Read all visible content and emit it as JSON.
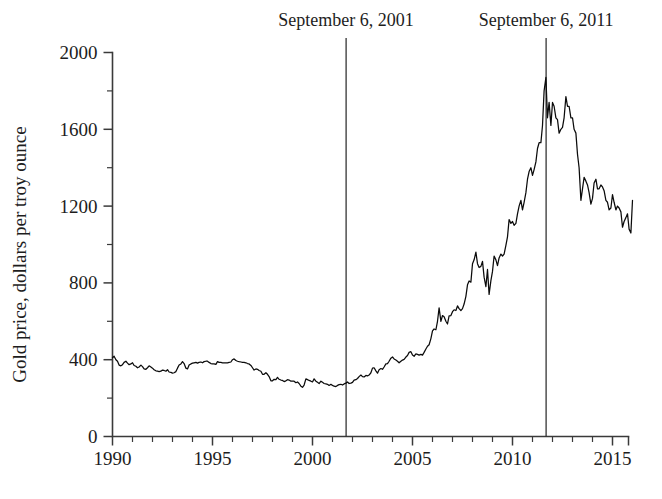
{
  "figure": {
    "background_color": "#ffffff",
    "line_color": "#0b0b0b",
    "axis_color": "#3a3a3a",
    "annotation_color": "#2c2c2c"
  },
  "chart_data": {
    "type": "line",
    "title": "",
    "subtitle": "",
    "xlabel": "",
    "ylabel": "Gold price, dollars per troy ounce",
    "xlim": [
      1990,
      2015.8
    ],
    "ylim": [
      0,
      2000
    ],
    "grid": false,
    "legend": "none",
    "x_major_ticks": [
      1990,
      1995,
      2000,
      2005,
      2010,
      2015
    ],
    "x_major_tick_labels": [
      "1990",
      "1995",
      "2000",
      "2005",
      "2010",
      "2015"
    ],
    "x_minor_ticks": [
      1991,
      1992,
      1993,
      1994,
      1996,
      1997,
      1998,
      1999,
      2001,
      2002,
      2003,
      2004,
      2006,
      2007,
      2008,
      2009,
      2011,
      2012,
      2013,
      2014
    ],
    "y_major_ticks": [
      0,
      400,
      800,
      1200,
      1600,
      2000
    ],
    "y_major_tick_labels": [
      "0",
      "400",
      "800",
      "1200",
      "1600",
      "2000"
    ],
    "y_minor_ticks": [
      200,
      600,
      1000,
      1400,
      1800
    ],
    "annotations": [
      {
        "label": "September 6, 2001",
        "x": 2001.68,
        "type": "vertical-rule"
      },
      {
        "label": "September 6, 2011",
        "x": 2011.68,
        "type": "vertical-rule"
      }
    ],
    "series": [
      {
        "name": "Gold price",
        "x": [
          1990.0,
          1990.08,
          1990.17,
          1990.25,
          1990.33,
          1990.42,
          1990.5,
          1990.58,
          1990.67,
          1990.75,
          1990.83,
          1990.92,
          1991.0,
          1991.08,
          1991.17,
          1991.25,
          1991.33,
          1991.42,
          1991.5,
          1991.58,
          1991.67,
          1991.75,
          1991.83,
          1991.92,
          1992.0,
          1992.08,
          1992.17,
          1992.25,
          1992.33,
          1992.42,
          1992.5,
          1992.58,
          1992.67,
          1992.75,
          1992.83,
          1992.92,
          1993.0,
          1993.08,
          1993.17,
          1993.25,
          1993.33,
          1993.42,
          1993.5,
          1993.58,
          1993.67,
          1993.75,
          1993.83,
          1993.92,
          1994.0,
          1994.08,
          1994.17,
          1994.25,
          1994.33,
          1994.42,
          1994.5,
          1994.58,
          1994.67,
          1994.75,
          1994.83,
          1994.92,
          1995.0,
          1995.08,
          1995.17,
          1995.25,
          1995.33,
          1995.42,
          1995.5,
          1995.58,
          1995.67,
          1995.75,
          1995.83,
          1995.92,
          1996.0,
          1996.08,
          1996.17,
          1996.25,
          1996.33,
          1996.42,
          1996.5,
          1996.58,
          1996.67,
          1996.75,
          1996.83,
          1996.92,
          1997.0,
          1997.08,
          1997.17,
          1997.25,
          1997.33,
          1997.42,
          1997.5,
          1997.58,
          1997.67,
          1997.75,
          1997.83,
          1997.92,
          1998.0,
          1998.08,
          1998.17,
          1998.25,
          1998.33,
          1998.42,
          1998.5,
          1998.58,
          1998.67,
          1998.75,
          1998.83,
          1998.92,
          1999.0,
          1999.08,
          1999.17,
          1999.25,
          1999.33,
          1999.42,
          1999.5,
          1999.58,
          1999.67,
          1999.75,
          1999.83,
          1999.92,
          2000.0,
          2000.08,
          2000.17,
          2000.25,
          2000.33,
          2000.42,
          2000.5,
          2000.58,
          2000.67,
          2000.75,
          2000.83,
          2000.92,
          2001.0,
          2001.08,
          2001.17,
          2001.25,
          2001.33,
          2001.42,
          2001.5,
          2001.58,
          2001.67,
          2001.75,
          2001.83,
          2001.92,
          2002.0,
          2002.08,
          2002.17,
          2002.25,
          2002.33,
          2002.42,
          2002.5,
          2002.58,
          2002.67,
          2002.75,
          2002.83,
          2002.92,
          2003.0,
          2003.08,
          2003.17,
          2003.25,
          2003.33,
          2003.42,
          2003.5,
          2003.58,
          2003.67,
          2003.75,
          2003.83,
          2003.92,
          2004.0,
          2004.08,
          2004.17,
          2004.25,
          2004.33,
          2004.42,
          2004.5,
          2004.58,
          2004.67,
          2004.75,
          2004.83,
          2004.92,
          2005.0,
          2005.08,
          2005.17,
          2005.25,
          2005.33,
          2005.42,
          2005.5,
          2005.58,
          2005.67,
          2005.75,
          2005.83,
          2005.92,
          2006.0,
          2006.08,
          2006.17,
          2006.25,
          2006.33,
          2006.42,
          2006.5,
          2006.58,
          2006.67,
          2006.75,
          2006.83,
          2006.92,
          2007.0,
          2007.08,
          2007.17,
          2007.25,
          2007.33,
          2007.42,
          2007.5,
          2007.58,
          2007.67,
          2007.75,
          2007.83,
          2007.92,
          2008.0,
          2008.08,
          2008.17,
          2008.25,
          2008.33,
          2008.42,
          2008.5,
          2008.58,
          2008.67,
          2008.75,
          2008.83,
          2008.92,
          2009.0,
          2009.08,
          2009.17,
          2009.25,
          2009.33,
          2009.42,
          2009.5,
          2009.58,
          2009.67,
          2009.75,
          2009.83,
          2009.92,
          2010.0,
          2010.08,
          2010.17,
          2010.25,
          2010.33,
          2010.42,
          2010.5,
          2010.58,
          2010.67,
          2010.75,
          2010.83,
          2010.92,
          2011.0,
          2011.08,
          2011.17,
          2011.25,
          2011.33,
          2011.42,
          2011.5,
          2011.58,
          2011.67,
          2011.75,
          2011.83,
          2011.92,
          2012.0,
          2012.08,
          2012.17,
          2012.25,
          2012.33,
          2012.42,
          2012.5,
          2012.58,
          2012.67,
          2012.75,
          2012.83,
          2012.92,
          2013.0,
          2013.08,
          2013.17,
          2013.25,
          2013.33,
          2013.42,
          2013.5,
          2013.58,
          2013.67,
          2013.75,
          2013.83,
          2013.92,
          2014.0,
          2014.08,
          2014.17,
          2014.25,
          2014.33,
          2014.42,
          2014.5,
          2014.58,
          2014.67,
          2014.75,
          2014.83,
          2014.92,
          2015.0,
          2015.08,
          2015.17,
          2015.25,
          2015.33,
          2015.42,
          2015.5,
          2015.58,
          2015.67,
          2015.75,
          2015.83,
          2015.92,
          2016.0
        ],
        "values": [
          410,
          418,
          400,
          392,
          372,
          368,
          374,
          386,
          392,
          382,
          374,
          378,
          384,
          370,
          366,
          358,
          362,
          372,
          364,
          352,
          350,
          358,
          368,
          362,
          356,
          348,
          342,
          340,
          338,
          340,
          346,
          344,
          340,
          348,
          336,
          334,
          330,
          332,
          338,
          356,
          372,
          378,
          390,
          380,
          356,
          352,
          372,
          378,
          382,
          384,
          386,
          382,
          386,
          388,
          384,
          390,
          392,
          392,
          386,
          380,
          378,
          378,
          376,
          390,
          386,
          386,
          384,
          384,
          384,
          384,
          386,
          388,
          400,
          404,
          396,
          392,
          390,
          388,
          386,
          386,
          384,
          380,
          378,
          370,
          358,
          346,
          352,
          350,
          344,
          340,
          324,
          324,
          332,
          324,
          312,
          290,
          290,
          298,
          296,
          308,
          298,
          294,
          292,
          286,
          290,
          296,
          294,
          288,
          288,
          288,
          280,
          284,
          276,
          262,
          256,
          268,
          300,
          296,
          292,
          288,
          284,
          300,
          288,
          282,
          276,
          288,
          282,
          276,
          274,
          272,
          266,
          272,
          266,
          262,
          260,
          266,
          270,
          272,
          268,
          274,
          278,
          284,
          276,
          278,
          282,
          294,
          296,
          302,
          312,
          320,
          312,
          310,
          318,
          316,
          320,
          332,
          356,
          358,
          342,
          330,
          348,
          354,
          350,
          362,
          378,
          380,
          392,
          408,
          414,
          404,
          398,
          392,
          384,
          392,
          398,
          402,
          414,
          422,
          438,
          442,
          424,
          418,
          430,
          428,
          424,
          428,
          424,
          438,
          456,
          470,
          478,
          510,
          550,
          560,
          556,
          600,
          670,
          600,
          630,
          624,
          600,
          586,
          628,
          630,
          650,
          660,
          656,
          680,
          666,
          656,
          666,
          690,
          730,
          790,
          810,
          804,
          900,
          920,
          960,
          900,
          880,
          886,
          912,
          830,
          780,
          870,
          740,
          812,
          860,
          940,
          920,
          890,
          930,
          950,
          940,
          950,
          996,
          1040,
          1130,
          1110,
          1120,
          1100,
          1110,
          1160,
          1200,
          1230,
          1180,
          1220,
          1270,
          1340,
          1380,
          1400,
          1360,
          1390,
          1430,
          1500,
          1530,
          1530,
          1620,
          1800,
          1870,
          1660,
          1740,
          1620,
          1740,
          1720,
          1660,
          1650,
          1580,
          1600,
          1610,
          1660,
          1770,
          1720,
          1720,
          1660,
          1660,
          1600,
          1580,
          1470,
          1400,
          1230,
          1290,
          1350,
          1330,
          1310,
          1270,
          1210,
          1240,
          1320,
          1340,
          1290,
          1290,
          1310,
          1300,
          1280,
          1230,
          1220,
          1180,
          1190,
          1260,
          1220,
          1180,
          1200,
          1190,
          1170,
          1090,
          1120,
          1140,
          1160,
          1080,
          1060,
          1230
        ]
      }
    ]
  }
}
